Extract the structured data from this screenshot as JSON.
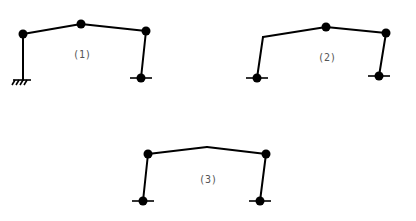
{
  "diagram": {
    "type": "structural frames",
    "frames": [
      {
        "id": "1",
        "label": "(1)",
        "label_pos": [
          82,
          58
        ],
        "members": [
          [
            23,
            80,
            23,
            34
          ],
          [
            23,
            34,
            81,
            24
          ],
          [
            81,
            24,
            146,
            31
          ],
          [
            146,
            31,
            141,
            78
          ]
        ],
        "hinge_nodes": [
          [
            23,
            34
          ],
          [
            81,
            24
          ],
          [
            146,
            31
          ],
          [
            141,
            78
          ]
        ],
        "supports": [
          {
            "type": "fixed",
            "x": 22,
            "y": 80
          },
          {
            "type": "pinned",
            "x": 141,
            "y": 78
          }
        ]
      },
      {
        "id": "2",
        "label": "(2)",
        "label_pos": [
          327,
          61
        ],
        "members": [
          [
            257,
            78,
            263,
            37
          ],
          [
            263,
            37,
            326,
            27
          ],
          [
            326,
            27,
            386,
            33
          ],
          [
            386,
            33,
            379,
            76
          ]
        ],
        "hinge_nodes": [
          [
            326,
            27
          ],
          [
            386,
            33
          ],
          [
            257,
            78
          ],
          [
            379,
            76
          ]
        ],
        "supports": [
          {
            "type": "pinned",
            "x": 257,
            "y": 78
          },
          {
            "type": "pinned",
            "x": 379,
            "y": 76
          }
        ]
      },
      {
        "id": "3",
        "label": "(3)",
        "label_pos": [
          208,
          183
        ],
        "members": [
          [
            143,
            201,
            148,
            154
          ],
          [
            148,
            154,
            207,
            147
          ],
          [
            207,
            147,
            266,
            154
          ],
          [
            266,
            154,
            260,
            201
          ]
        ],
        "hinge_nodes": [
          [
            148,
            154
          ],
          [
            266,
            154
          ],
          [
            143,
            201
          ],
          [
            260,
            201
          ]
        ],
        "supports": [
          {
            "type": "pinned",
            "x": 143,
            "y": 201
          },
          {
            "type": "pinned",
            "x": 260,
            "y": 201
          }
        ]
      }
    ]
  }
}
